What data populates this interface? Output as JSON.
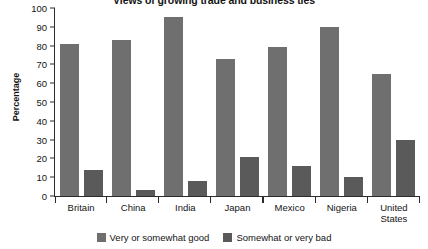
{
  "chart_data": {
    "type": "bar",
    "title": "Views of growing trade and business ties",
    "xlabel": "",
    "ylabel": "Percentage",
    "ylim": [
      0,
      100
    ],
    "ytick_step": 10,
    "yticks": [
      100,
      90,
      80,
      70,
      60,
      50,
      40,
      30,
      20,
      10,
      0
    ],
    "grid": false,
    "legend_position": "bottom",
    "categories": [
      "Britain",
      "China",
      "India",
      "Japan",
      "Mexico",
      "Nigeria",
      "United States"
    ],
    "series": [
      {
        "name": "Very or somewhat good",
        "color": "#6f6f6f",
        "values": [
          81,
          83,
          95,
          73,
          79,
          90,
          65
        ]
      },
      {
        "name": "Somewhat or very bad",
        "color": "#5a5a5a",
        "values": [
          14,
          3,
          8,
          21,
          16,
          10,
          30
        ]
      }
    ]
  }
}
